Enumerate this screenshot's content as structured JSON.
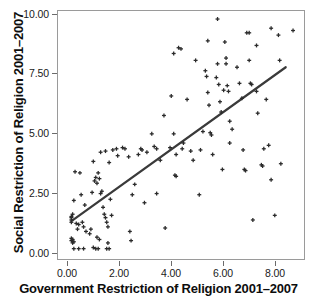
{
  "chart_data": {
    "type": "scatter",
    "title": "",
    "xlabel": "Government Restriction of Religion 2001–2007",
    "ylabel": "Social Restriction of Religion 2001–2007",
    "xlim": [
      -0.55,
      9.55
    ],
    "ylim": [
      -0.35,
      10.45
    ],
    "xticks": [
      0.0,
      2.0,
      4.0,
      6.0,
      8.0
    ],
    "xticklabels": [
      "0.00",
      "2.00",
      "4.00",
      "6.00",
      "8.00"
    ],
    "yticks": [
      0.0,
      2.5,
      5.0,
      7.5,
      10.0
    ],
    "yticklabels": [
      "0.00",
      "2.50",
      "5.00",
      "7.50",
      "10.00"
    ],
    "grid": false,
    "legend": null,
    "marker": "plus",
    "marker_color": "#2b2b2b",
    "frame_color": "#9a9a9a",
    "trendline": {
      "type": "linear-fit",
      "color": "#3a3a3a",
      "width": 2.2,
      "x_start": 0.0,
      "y_start": 1.3,
      "x_end": 8.8,
      "y_end": 8.0,
      "slope": 0.761,
      "intercept": 1.3
    },
    "points": [
      [
        0.0,
        1.45
      ],
      [
        0.0,
        1.35
      ],
      [
        0.0,
        1.5
      ],
      [
        0.0,
        1.25
      ],
      [
        0.05,
        1.6
      ],
      [
        0.0,
        0.45
      ],
      [
        0.05,
        0.5
      ],
      [
        0.1,
        0.4
      ],
      [
        0.05,
        0.35
      ],
      [
        0.0,
        0.55
      ],
      [
        0.1,
        0.1
      ],
      [
        0.3,
        0.1
      ],
      [
        0.5,
        0.1
      ],
      [
        0.15,
        3.45
      ],
      [
        0.35,
        3.4
      ],
      [
        0.1,
        2.2
      ],
      [
        0.4,
        2.45
      ],
      [
        0.55,
        2.0
      ],
      [
        0.45,
        1.25
      ],
      [
        0.5,
        1.05
      ],
      [
        0.6,
        0.85
      ],
      [
        0.75,
        0.75
      ],
      [
        0.8,
        0.95
      ],
      [
        0.9,
        0.15
      ],
      [
        1.0,
        0.1
      ],
      [
        1.1,
        0.1
      ],
      [
        0.85,
        2.55
      ],
      [
        0.95,
        3.05
      ],
      [
        1.0,
        3.2
      ],
      [
        1.05,
        2.95
      ],
      [
        1.1,
        3.4
      ],
      [
        1.15,
        3.15
      ],
      [
        1.2,
        2.5
      ],
      [
        1.25,
        2.6
      ],
      [
        1.3,
        1.9
      ],
      [
        1.35,
        1.6
      ],
      [
        1.4,
        1.45
      ],
      [
        1.45,
        1.25
      ],
      [
        1.5,
        1.05
      ],
      [
        1.5,
        0.35
      ],
      [
        1.45,
        0.1
      ],
      [
        1.55,
        0.1
      ],
      [
        0.9,
        3.9
      ],
      [
        1.2,
        4.3
      ],
      [
        1.4,
        4.35
      ],
      [
        1.55,
        3.85
      ],
      [
        1.6,
        2.25
      ],
      [
        1.65,
        1.55
      ],
      [
        1.7,
        4.4
      ],
      [
        1.85,
        4.45
      ],
      [
        1.9,
        4.15
      ],
      [
        2.1,
        4.5
      ],
      [
        2.2,
        4.45
      ],
      [
        2.35,
        4.1
      ],
      [
        2.45,
        0.45
      ],
      [
        2.4,
        0.85
      ],
      [
        2.6,
        2.9
      ],
      [
        2.75,
        4.2
      ],
      [
        2.85,
        4.45
      ],
      [
        2.9,
        4.4
      ],
      [
        3.0,
        2.1
      ],
      [
        3.1,
        4.3
      ],
      [
        3.3,
        5.1
      ],
      [
        3.4,
        4.55
      ],
      [
        3.5,
        4.45
      ],
      [
        3.5,
        2.5
      ],
      [
        3.8,
        5.9
      ],
      [
        3.85,
        1.0
      ],
      [
        4.1,
        6.75
      ],
      [
        4.2,
        8.6
      ],
      [
        4.2,
        5.1
      ],
      [
        4.25,
        3.3
      ],
      [
        4.3,
        3.25
      ],
      [
        4.3,
        4.2
      ],
      [
        4.5,
        8.8
      ],
      [
        4.4,
        8.85
      ],
      [
        4.55,
        4.45
      ],
      [
        4.6,
        4.7
      ],
      [
        4.75,
        6.6
      ],
      [
        4.9,
        4.35
      ],
      [
        5.0,
        3.95
      ],
      [
        5.1,
        8.3
      ],
      [
        5.25,
        2.45
      ],
      [
        5.3,
        4.4
      ],
      [
        5.4,
        5.2
      ],
      [
        5.5,
        7.85
      ],
      [
        5.55,
        7.6
      ],
      [
        5.6,
        9.15
      ],
      [
        5.6,
        6.9
      ],
      [
        5.65,
        6.35
      ],
      [
        5.7,
        5.15
      ],
      [
        5.75,
        5.05
      ],
      [
        5.8,
        4.2
      ],
      [
        6.0,
        10.1
      ],
      [
        6.0,
        8.15
      ],
      [
        6.05,
        7.25
      ],
      [
        6.1,
        6.5
      ],
      [
        6.15,
        6.05
      ],
      [
        6.2,
        3.55
      ],
      [
        6.3,
        9.1
      ],
      [
        6.35,
        8.4
      ],
      [
        6.35,
        8.15
      ],
      [
        6.4,
        7.2
      ],
      [
        6.45,
        6.95
      ],
      [
        6.5,
        5.65
      ],
      [
        6.5,
        4.7
      ],
      [
        6.6,
        5.3
      ],
      [
        6.8,
        8.0
      ],
      [
        6.9,
        7.3
      ],
      [
        7.0,
        6.65
      ],
      [
        7.05,
        4.4
      ],
      [
        7.1,
        3.55
      ],
      [
        7.15,
        3.5
      ],
      [
        7.2,
        9.5
      ],
      [
        7.3,
        9.5
      ],
      [
        7.3,
        8.3
      ],
      [
        7.35,
        7.3
      ],
      [
        7.4,
        7.25
      ],
      [
        7.45,
        1.35
      ],
      [
        7.6,
        8.95
      ],
      [
        7.6,
        6.95
      ],
      [
        7.65,
        6.0
      ],
      [
        7.8,
        3.75
      ],
      [
        7.85,
        3.7
      ],
      [
        7.9,
        4.45
      ],
      [
        8.0,
        6.6
      ],
      [
        8.1,
        4.6
      ],
      [
        8.2,
        9.7
      ],
      [
        8.2,
        3.1
      ],
      [
        8.35,
        1.55
      ],
      [
        8.5,
        9.4
      ],
      [
        8.55,
        8.3
      ],
      [
        8.6,
        3.8
      ],
      [
        9.1,
        9.6
      ],
      [
        0.2,
        1.2
      ],
      [
        0.25,
        0.95
      ],
      [
        0.3,
        1.15
      ],
      [
        1.05,
        0.6
      ],
      [
        1.15,
        0.5
      ],
      [
        2.5,
        2.45
      ],
      [
        3.65,
        3.95
      ],
      [
        4.05,
        4.5
      ],
      [
        5.95,
        7.55
      ],
      [
        6.25,
        7.0
      ]
    ]
  }
}
